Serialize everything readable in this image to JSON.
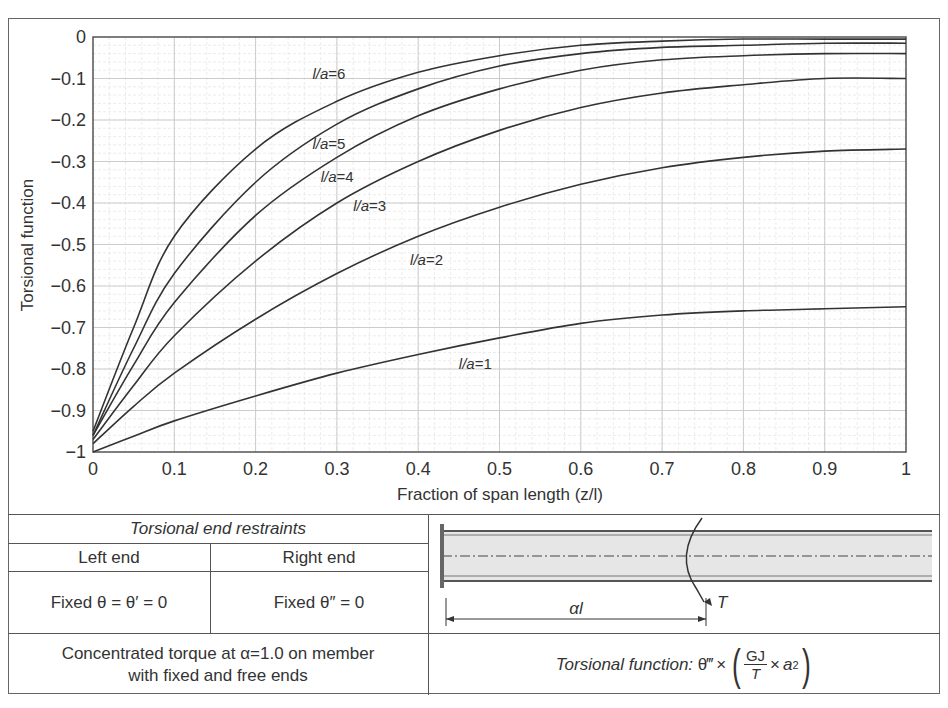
{
  "chart_data": {
    "type": "line",
    "title": "",
    "xlabel": "Fraction of span length (z/l)",
    "ylabel": "Torsional function",
    "xlim": [
      0,
      1
    ],
    "ylim": [
      -1,
      0
    ],
    "grid": true,
    "x_ticks": [
      "0",
      "0.1",
      "0.2",
      "0.3",
      "0.4",
      "0.5",
      "0.6",
      "0.7",
      "0.8",
      "0.9",
      "1"
    ],
    "y_ticks": [
      "0",
      "−0.1",
      "−0.2",
      "−0.3",
      "−0.4",
      "−0.5",
      "−0.6",
      "−0.7",
      "−0.8",
      "−0.9",
      "−1"
    ],
    "x": [
      0,
      0.05,
      0.1,
      0.2,
      0.3,
      0.4,
      0.5,
      0.6,
      0.7,
      0.8,
      0.9,
      1.0
    ],
    "series": [
      {
        "name": "l/a=1",
        "label_pos": [
          0.45,
          -0.8
        ],
        "values": [
          -1.0,
          -0.962,
          -0.925,
          -0.865,
          -0.81,
          -0.765,
          -0.725,
          -0.69,
          -0.67,
          -0.66,
          -0.655,
          -0.65
        ]
      },
      {
        "name": "l/a=2",
        "label_pos": [
          0.39,
          -0.55
        ],
        "values": [
          -0.98,
          -0.89,
          -0.81,
          -0.68,
          -0.57,
          -0.48,
          -0.41,
          -0.355,
          -0.315,
          -0.29,
          -0.275,
          -0.27
        ]
      },
      {
        "name": "l/a=3",
        "label_pos": [
          0.32,
          -0.42
        ],
        "values": [
          -0.97,
          -0.84,
          -0.72,
          -0.54,
          -0.4,
          -0.3,
          -0.225,
          -0.17,
          -0.135,
          -0.115,
          -0.1,
          -0.1
        ]
      },
      {
        "name": "l/a=4",
        "label_pos": [
          0.28,
          -0.35
        ],
        "values": [
          -0.96,
          -0.79,
          -0.64,
          -0.43,
          -0.29,
          -0.19,
          -0.125,
          -0.08,
          -0.055,
          -0.045,
          -0.04,
          -0.04
        ]
      },
      {
        "name": "l/a=5",
        "label_pos": [
          0.27,
          -0.27
        ],
        "values": [
          -0.96,
          -0.75,
          -0.57,
          -0.35,
          -0.21,
          -0.125,
          -0.07,
          -0.04,
          -0.025,
          -0.02,
          -0.015,
          -0.015
        ]
      },
      {
        "name": "l/a=6",
        "label_pos": [
          0.27,
          -0.1
        ],
        "values": [
          -0.95,
          -0.7,
          -0.48,
          -0.27,
          -0.155,
          -0.085,
          -0.045,
          -0.02,
          -0.01,
          -0.005,
          -0.005,
          -0.005
        ]
      }
    ],
    "line_color": "#333333",
    "grid_color": "#cccccc"
  },
  "table": {
    "header": "Torsional end restraints",
    "left_end_label": "Left end",
    "right_end_label": "Right end",
    "left_end_value": "Fixed θ = θ′ = 0",
    "right_end_value": "Fixed θ″ = 0",
    "description_line1": "Concentrated torque at α=1.0 on member",
    "description_line2": "with fixed and free ends",
    "formula_prefix": "Torsional function: ",
    "formula_theta": "θ‴",
    "formula_times": "×",
    "formula_num": "GJ",
    "formula_den": "T",
    "formula_a": "a",
    "formula_exp": "2"
  },
  "diagram": {
    "span_label": "αl",
    "torque_label": "T"
  }
}
